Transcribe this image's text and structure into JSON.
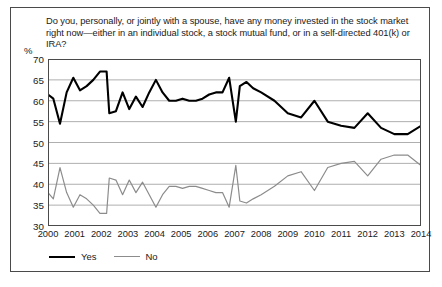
{
  "chart_data": {
    "type": "line",
    "title": "Do you, personally, or jointly with a spouse, have any money invested in the stock market right now—either in an individual stock, a stock mutual fund, or in a self-directed 401(k) or IRA?",
    "xlabel": "",
    "ylabel": "%",
    "ylim": [
      30,
      70
    ],
    "yticks": [
      30,
      35,
      40,
      45,
      50,
      55,
      60,
      65,
      70
    ],
    "xlim": [
      2000,
      2014
    ],
    "categories": [
      "2000",
      "2001",
      "2002",
      "2003",
      "2004",
      "2005",
      "2006",
      "2007",
      "2008",
      "2009",
      "2010",
      "2011",
      "2012",
      "2013",
      "2014"
    ],
    "grid": true,
    "legend_position": "bottom-left",
    "series": [
      {
        "name": "Yes",
        "color": "#000000",
        "x": [
          2000.0,
          2000.2,
          2000.45,
          2000.7,
          2000.95,
          2001.2,
          2001.45,
          2001.7,
          2001.95,
          2002.2,
          2002.3,
          2002.55,
          2002.8,
          2003.05,
          2003.3,
          2003.55,
          2003.8,
          2004.05,
          2004.3,
          2004.55,
          2004.8,
          2005.05,
          2005.3,
          2005.55,
          2005.8,
          2006.05,
          2006.3,
          2006.55,
          2006.8,
          2007.05,
          2007.2,
          2007.45,
          2007.7,
          2008.0,
          2008.5,
          2009.0,
          2009.5,
          2010.0,
          2010.5,
          2011.0,
          2011.5,
          2012.0,
          2012.5,
          2013.0,
          2013.5,
          2014.0
        ],
        "values": [
          61.5,
          60.5,
          54.5,
          62.0,
          65.5,
          62.5,
          63.5,
          65.0,
          67.0,
          67.0,
          57.0,
          57.5,
          62.0,
          58.0,
          61.0,
          58.5,
          62.0,
          65.0,
          62.0,
          60.0,
          60.0,
          60.5,
          60.0,
          60.0,
          60.5,
          61.5,
          62.0,
          62.0,
          65.5,
          55.0,
          63.5,
          64.5,
          63.0,
          62.0,
          60.0,
          57.0,
          56.0,
          60.0,
          55.0,
          54.0,
          53.5,
          57.0,
          53.5,
          52.0,
          52.0,
          54.0
        ]
      },
      {
        "name": "No",
        "color": "#8c8c8c",
        "x": [
          2000.0,
          2000.2,
          2000.45,
          2000.7,
          2000.95,
          2001.2,
          2001.45,
          2001.7,
          2001.95,
          2002.2,
          2002.3,
          2002.55,
          2002.8,
          2003.05,
          2003.3,
          2003.55,
          2003.8,
          2004.05,
          2004.3,
          2004.55,
          2004.8,
          2005.05,
          2005.3,
          2005.55,
          2005.8,
          2006.05,
          2006.3,
          2006.55,
          2006.8,
          2007.05,
          2007.2,
          2007.45,
          2007.7,
          2008.0,
          2008.5,
          2009.0,
          2009.5,
          2010.0,
          2010.5,
          2011.0,
          2011.5,
          2012.0,
          2012.5,
          2013.0,
          2013.5,
          2014.0
        ],
        "values": [
          38.0,
          36.5,
          44.0,
          38.0,
          34.5,
          37.5,
          36.5,
          35.0,
          33.0,
          33.0,
          41.5,
          41.0,
          37.5,
          41.0,
          38.0,
          40.5,
          37.5,
          34.5,
          37.5,
          39.5,
          39.5,
          39.0,
          39.5,
          39.5,
          39.0,
          38.5,
          38.0,
          38.0,
          34.5,
          44.5,
          36.0,
          35.5,
          36.5,
          37.5,
          39.5,
          42.0,
          43.0,
          38.5,
          44.0,
          45.0,
          45.5,
          42.0,
          46.0,
          47.0,
          47.0,
          44.5
        ]
      }
    ]
  },
  "question": {
    "text": "Do you, personally, or jointly with a spouse, have any money invested in the stock market right now—either in an individual stock, a stock mutual fund, or in a self-directed 401(k) or IRA?"
  },
  "axis": {
    "y_unit_label": "%"
  },
  "legend": {
    "items": [
      {
        "label": "Yes"
      },
      {
        "label": "No"
      }
    ]
  }
}
